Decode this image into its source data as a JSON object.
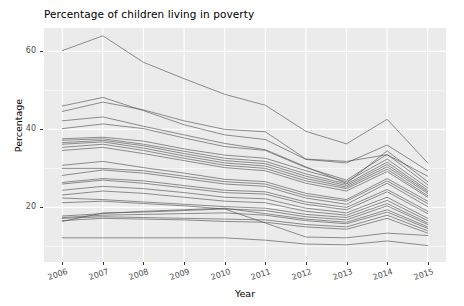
{
  "chart_data": {
    "type": "line",
    "title": "Percentage of children living in poverty",
    "xlabel": "Year",
    "ylabel": "Percentage",
    "x": [
      2006,
      2007,
      2008,
      2009,
      2010,
      2011,
      2012,
      2013,
      2014,
      2015
    ],
    "x_tick_labels": [
      "2006",
      "2007",
      "2008",
      "2009",
      "2010",
      "2011",
      "2012",
      "2013",
      "2014",
      "2015"
    ],
    "y_tick_labels": [
      "20",
      "40",
      "60"
    ],
    "y_ticks": [
      20,
      40,
      60
    ],
    "xlim": [
      2005.55,
      2015.45
    ],
    "ylim": [
      6.0,
      66.0
    ],
    "grid": true,
    "grid_color": "#ffffff",
    "panel_color": "#ebebeb",
    "line_color": "#4d4d4d",
    "legend": "none",
    "series": [
      {
        "name": "series-01",
        "values": [
          60.2,
          64.0,
          57.2,
          53.0,
          49.0,
          46.2,
          39.5,
          36.3,
          42.6,
          31.4
        ]
      },
      {
        "name": "series-02",
        "values": [
          46.0,
          48.2,
          44.8,
          41.2,
          38.6,
          37.4,
          32.3,
          31.4,
          36.0,
          29.4
        ]
      },
      {
        "name": "series-03",
        "values": [
          44.6,
          47.0,
          45.0,
          42.2,
          40.0,
          39.4,
          32.4,
          31.8,
          33.5,
          28.0
        ]
      },
      {
        "name": "series-04",
        "values": [
          42.2,
          43.2,
          40.8,
          38.6,
          36.4,
          34.8,
          30.4,
          26.2,
          34.5,
          26.6
        ]
      },
      {
        "name": "series-05",
        "values": [
          40.2,
          41.4,
          40.2,
          37.8,
          35.6,
          34.6,
          30.2,
          27.0,
          33.6,
          25.8
        ]
      },
      {
        "name": "series-06",
        "values": [
          37.6,
          38.0,
          37.0,
          35.0,
          33.4,
          32.6,
          29.4,
          26.6,
          32.4,
          25.0
        ]
      },
      {
        "name": "series-07",
        "values": [
          37.2,
          37.6,
          36.2,
          34.4,
          32.6,
          31.8,
          28.6,
          26.0,
          31.6,
          24.4
        ]
      },
      {
        "name": "series-08",
        "values": [
          36.6,
          37.2,
          35.8,
          33.8,
          32.0,
          31.2,
          28.0,
          25.6,
          31.0,
          24.0
        ]
      },
      {
        "name": "series-09",
        "values": [
          36.2,
          36.8,
          35.2,
          33.2,
          31.4,
          30.6,
          27.4,
          25.2,
          30.4,
          23.6
        ]
      },
      {
        "name": "series-10",
        "values": [
          35.4,
          36.2,
          34.6,
          32.6,
          30.8,
          30.0,
          26.8,
          24.8,
          29.8,
          23.0
        ]
      },
      {
        "name": "series-11",
        "values": [
          34.6,
          35.4,
          33.8,
          32.0,
          30.2,
          29.4,
          26.2,
          24.2,
          29.2,
          22.6
        ]
      },
      {
        "name": "series-12",
        "values": [
          30.8,
          31.8,
          30.2,
          28.8,
          27.2,
          26.6,
          23.6,
          22.0,
          27.4,
          21.6
        ]
      },
      {
        "name": "series-13",
        "values": [
          30.0,
          30.0,
          29.4,
          28.0,
          26.6,
          26.0,
          23.0,
          21.6,
          26.8,
          21.0
        ]
      },
      {
        "name": "series-14",
        "values": [
          28.2,
          29.6,
          28.8,
          27.4,
          26.0,
          25.4,
          22.4,
          20.8,
          26.2,
          20.2
        ]
      },
      {
        "name": "series-15",
        "values": [
          26.4,
          27.4,
          26.8,
          25.6,
          24.4,
          24.0,
          21.4,
          20.0,
          24.6,
          19.0
        ]
      },
      {
        "name": "series-16",
        "values": [
          26.0,
          27.0,
          26.2,
          25.0,
          23.8,
          23.4,
          20.8,
          19.4,
          24.0,
          18.4
        ]
      },
      {
        "name": "series-17",
        "values": [
          24.4,
          25.4,
          24.8,
          23.8,
          22.6,
          22.2,
          19.8,
          18.6,
          22.6,
          17.2
        ]
      },
      {
        "name": "series-18",
        "values": [
          23.2,
          24.2,
          23.6,
          22.6,
          21.6,
          21.2,
          19.0,
          18.0,
          21.8,
          16.6
        ]
      },
      {
        "name": "series-19",
        "values": [
          22.4,
          22.0,
          21.4,
          20.8,
          20.2,
          19.8,
          18.2,
          17.4,
          21.0,
          16.0
        ]
      },
      {
        "name": "series-20",
        "values": [
          21.2,
          21.6,
          21.0,
          20.4,
          19.6,
          19.2,
          17.6,
          16.8,
          20.4,
          15.6
        ]
      },
      {
        "name": "series-21",
        "values": [
          17.8,
          18.4,
          19.0,
          19.4,
          19.8,
          18.4,
          17.0,
          16.2,
          19.4,
          15.0
        ]
      },
      {
        "name": "series-22",
        "values": [
          17.4,
          18.0,
          18.2,
          18.4,
          18.6,
          18.0,
          16.6,
          15.8,
          18.8,
          14.6
        ]
      },
      {
        "name": "series-23",
        "values": [
          17.2,
          17.6,
          17.4,
          17.2,
          17.0,
          16.8,
          15.6,
          15.0,
          18.0,
          14.0
        ]
      },
      {
        "name": "series-24",
        "values": [
          16.6,
          17.2,
          17.0,
          16.8,
          16.4,
          16.2,
          15.0,
          14.4,
          17.2,
          13.4
        ]
      },
      {
        "name": "series-25",
        "values": [
          16.4,
          18.6,
          18.8,
          19.2,
          19.6,
          16.0,
          12.4,
          12.2,
          13.4,
          12.8
        ]
      },
      {
        "name": "series-26",
        "values": [
          12.2,
          12.2,
          12.2,
          12.2,
          12.2,
          11.6,
          10.6,
          10.4,
          11.4,
          10.2
        ]
      }
    ]
  }
}
